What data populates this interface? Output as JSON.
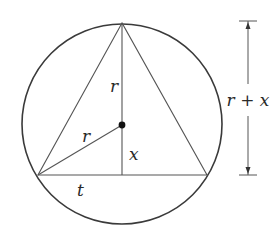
{
  "figure": {
    "type": "geometry-diagram",
    "circle": {
      "cx": 122,
      "cy": 124,
      "r": 100
    },
    "triangle": {
      "apex": [
        122,
        23
      ],
      "left": [
        38,
        175
      ],
      "right": [
        207,
        175
      ]
    },
    "center_point": [
      122,
      125
    ],
    "foot_point": [
      122,
      175
    ],
    "labels": {
      "upper_radius": "r",
      "slant_radius": "r",
      "center_to_base": "x",
      "half_base": "t",
      "height_dimension": "r + x"
    },
    "dimension": {
      "x": 248,
      "top": 21,
      "bottom": 175,
      "tick_half_width": 9,
      "gap_top": 84,
      "gap_bottom": 116
    },
    "colors": {
      "line": "#3a3a3a",
      "thin_line": "#555555",
      "text": "#2a2a2a",
      "background": "#ffffff"
    }
  }
}
